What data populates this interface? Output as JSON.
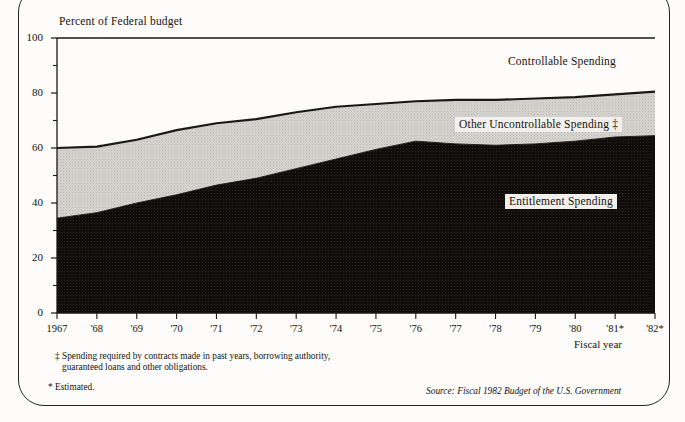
{
  "chart_data": {
    "type": "area",
    "title": "Percent of Federal budget",
    "xlabel": "Fiscal year",
    "ylabel": "Percent of Federal budget",
    "ylim": [
      0,
      100
    ],
    "yticks": [
      0,
      20,
      40,
      60,
      80,
      100
    ],
    "yticks_minor": [
      10,
      30,
      50,
      70,
      90
    ],
    "grid": false,
    "stacked": true,
    "legend_position": "inline-annotations",
    "categories": [
      "1967",
      "'68",
      "'69",
      "'70",
      "'71",
      "'72",
      "'73",
      "'74",
      "'75",
      "'76",
      "'77",
      "'78",
      "'79",
      "'80",
      "'81*",
      "'82*"
    ],
    "x": [
      1967,
      1968,
      1969,
      1970,
      1971,
      1972,
      1973,
      1974,
      1975,
      1976,
      1977,
      1978,
      1979,
      1980,
      1981,
      1982
    ],
    "series": [
      {
        "name": "Entitlement Spending",
        "color": "#100d0b",
        "values": [
          34.5,
          36.5,
          40.0,
          43.0,
          46.5,
          49.0,
          52.5,
          56.0,
          59.5,
          62.5,
          61.5,
          61.0,
          61.5,
          62.5,
          64.0,
          64.5
        ]
      },
      {
        "name": "Other Uncontrollable Spending",
        "color": "#d6d4d0",
        "values": [
          25.5,
          24.0,
          23.0,
          23.5,
          22.5,
          21.5,
          20.5,
          19.0,
          16.5,
          14.5,
          16.0,
          16.5,
          16.5,
          16.0,
          15.5,
          16.0
        ]
      },
      {
        "name": "Controllable Spending",
        "color": "#fdfcfa",
        "values": [
          40.0,
          39.5,
          37.0,
          33.5,
          31.0,
          29.5,
          27.0,
          25.0,
          24.0,
          23.0,
          22.5,
          22.5,
          22.0,
          21.5,
          20.5,
          19.5
        ]
      }
    ],
    "cumulative_upper_boundary": [
      60.0,
      60.5,
      63.0,
      66.5,
      69.0,
      70.5,
      73.0,
      75.0,
      76.0,
      77.0,
      77.5,
      77.5,
      78.0,
      78.5,
      79.5,
      80.5
    ],
    "annotations": [
      {
        "id": "controllable",
        "text": "Controllable Spending",
        "style": "plain"
      },
      {
        "id": "other-uncontrollable",
        "text": "Other Uncontrollable Spending ‡",
        "style": "boxed"
      },
      {
        "id": "entitlement",
        "text": "Entitlement Spending",
        "style": "boxed"
      }
    ],
    "footnotes": [
      "‡ Spending required by contracts made in past years, borrowing authority,",
      "guaranteed loans and other obligations.",
      "* Estimated."
    ],
    "source": "Source: Fiscal 1982 Budget of the U.S. Government"
  },
  "axis": {
    "y_tick_labels": [
      "100",
      "80",
      "60",
      "40",
      "20",
      "0"
    ],
    "x_tick_labels": [
      "1967",
      "'68",
      "'69",
      "'70",
      "'71",
      "'72",
      "'73",
      "'74",
      "'75",
      "'76",
      "'77",
      "'78",
      "'79",
      "'80",
      "'81*",
      "'82*"
    ],
    "x_axis_name": "Fiscal year"
  },
  "labels": {
    "title": "Percent of Federal budget",
    "controllable": "Controllable Spending",
    "other_uncontrollable": "Other Uncontrollable Spending ‡",
    "entitlement": "Entitlement Spending",
    "footnote_line1": "‡ Spending required by contracts made in past years, borrowing authority,",
    "footnote_line2": "guaranteed loans and other obligations.",
    "footnote_estimated": "* Estimated.",
    "source": "Source: Fiscal 1982 Budget of the U.S. Government"
  },
  "colors": {
    "entitlement": "#100d0b",
    "other_uncontrollable": "#d6d4d0",
    "controllable": "#fdfcfa",
    "axis": "#1b1713",
    "page_bg": "#fdfcfa"
  }
}
